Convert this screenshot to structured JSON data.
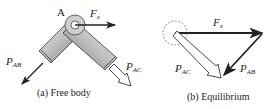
{
  "panel_a": {
    "caption": "(a) Free body",
    "joint_label": "A",
    "force_fx": {
      "base": "F",
      "sub": "x"
    },
    "force_pab": {
      "base": "P",
      "sub": "AB"
    },
    "force_pac": {
      "base": "P",
      "sub": "AC"
    }
  },
  "panel_b": {
    "caption": "(b) Equilibrium",
    "force_fx": {
      "base": "F",
      "sub": "x"
    },
    "force_pac": {
      "base": "P",
      "sub": "AC"
    },
    "force_pab": {
      "base": "P",
      "sub": "AB"
    }
  },
  "colors": {
    "ink": "#222222",
    "member_light": "#e6e6e6",
    "member_dark": "#8a8a8a"
  }
}
